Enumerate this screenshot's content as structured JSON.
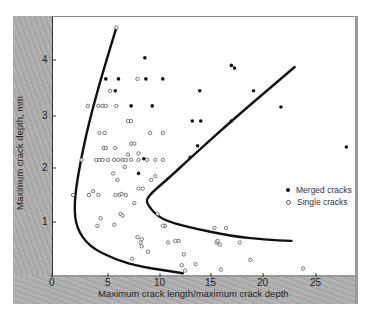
{
  "chart_data": {
    "type": "scatter",
    "title": "",
    "xlabel": "Maximum crack length/maximum crack depth",
    "ylabel": "Maximum crack depth, mm",
    "xlim": [
      0,
      28.7
    ],
    "ylim": [
      0,
      4.8
    ],
    "x_ticks": [
      "0",
      "5",
      "10",
      "15",
      "20",
      "25"
    ],
    "y_ticks": [
      "0",
      "1",
      "2",
      "3",
      "4"
    ],
    "grid": false,
    "legend_position": "right-middle",
    "legend": [
      {
        "label": "Merged cracks",
        "marker": "filled-circle"
      },
      {
        "label": "Single cracks",
        "marker": "open-circle"
      }
    ],
    "series": [
      {
        "name": "Merged cracks",
        "marker": "filled-circle",
        "points": [
          [
            8.8,
            4.04
          ],
          [
            5.1,
            3.65
          ],
          [
            6.3,
            3.65
          ],
          [
            8.9,
            3.65
          ],
          [
            10.5,
            3.65
          ],
          [
            6.0,
            3.43
          ],
          [
            7.5,
            3.15
          ],
          [
            9.5,
            3.15
          ],
          [
            17.0,
            3.9
          ],
          [
            17.3,
            3.85
          ],
          [
            14.0,
            3.43
          ],
          [
            19.1,
            3.43
          ],
          [
            13.3,
            2.87
          ],
          [
            14.1,
            2.87
          ],
          [
            17.0,
            2.87
          ],
          [
            13.8,
            2.41
          ],
          [
            13.1,
            2.2
          ],
          [
            27.9,
            2.39
          ],
          [
            8.7,
            2.17
          ],
          [
            8.2,
            1.9
          ],
          [
            21.7,
            3.13
          ]
        ]
      },
      {
        "name": "Single cracks",
        "marker": "open-circle",
        "points": [
          [
            6.1,
            4.6
          ],
          [
            8.1,
            3.65
          ],
          [
            5.5,
            3.43
          ],
          [
            4.4,
            3.15
          ],
          [
            4.8,
            3.15
          ],
          [
            5.1,
            3.15
          ],
          [
            6.1,
            3.15
          ],
          [
            3.4,
            3.15
          ],
          [
            7.2,
            2.87
          ],
          [
            7.5,
            2.87
          ],
          [
            4.5,
            2.65
          ],
          [
            5.0,
            2.65
          ],
          [
            9.3,
            2.65
          ],
          [
            10.5,
            2.65
          ],
          [
            4.9,
            2.37
          ],
          [
            5.1,
            2.37
          ],
          [
            6.0,
            2.37
          ],
          [
            7.5,
            2.45
          ],
          [
            7.8,
            2.45
          ],
          [
            2.8,
            2.15
          ],
          [
            4.2,
            2.15
          ],
          [
            4.5,
            2.15
          ],
          [
            4.8,
            2.15
          ],
          [
            5.3,
            2.15
          ],
          [
            5.9,
            2.15
          ],
          [
            6.3,
            2.15
          ],
          [
            6.7,
            2.15
          ],
          [
            7.0,
            2.15
          ],
          [
            7.5,
            2.15
          ],
          [
            8.2,
            2.15
          ],
          [
            9.0,
            2.15
          ],
          [
            9.8,
            2.15
          ],
          [
            10.5,
            2.15
          ],
          [
            7.2,
            2.25
          ],
          [
            8.2,
            2.27
          ],
          [
            6.9,
            2.02
          ],
          [
            5.8,
            1.9
          ],
          [
            6.2,
            1.78
          ],
          [
            9.4,
            1.78
          ],
          [
            9.8,
            1.85
          ],
          [
            2.0,
            1.5
          ],
          [
            3.5,
            1.5
          ],
          [
            3.9,
            1.57
          ],
          [
            4.4,
            1.5
          ],
          [
            6.0,
            1.5
          ],
          [
            6.4,
            1.5
          ],
          [
            6.6,
            1.52
          ],
          [
            7.0,
            1.5
          ],
          [
            8.2,
            1.62
          ],
          [
            8.6,
            1.62
          ],
          [
            7.8,
            1.35
          ],
          [
            4.6,
            1.07
          ],
          [
            6.5,
            1.15
          ],
          [
            6.7,
            1.12
          ],
          [
            4.3,
            0.93
          ],
          [
            5.9,
            0.95
          ],
          [
            10.0,
            1.15
          ],
          [
            8.1,
            0.72
          ],
          [
            8.4,
            0.62
          ],
          [
            8.5,
            0.68
          ],
          [
            8.5,
            0.55
          ],
          [
            9.1,
            0.45
          ],
          [
            10.7,
            0.93
          ],
          [
            11.0,
            0.62
          ],
          [
            12.0,
            0.65
          ],
          [
            12.5,
            0.4
          ],
          [
            12.3,
            0.2
          ],
          [
            13.6,
            0.22
          ],
          [
            15.4,
            0.89
          ],
          [
            16.5,
            0.89
          ],
          [
            15.6,
            0.62
          ],
          [
            15.7,
            0.65
          ],
          [
            15.9,
            0.58
          ],
          [
            17.8,
            0.62
          ],
          [
            11.7,
            0.65
          ],
          [
            10.5,
            0.93
          ],
          [
            16.0,
            0.12
          ],
          [
            18.8,
            0.3
          ],
          [
            23.8,
            0.14
          ],
          [
            12.6,
            0.1
          ],
          [
            7.6,
            0.32
          ]
        ]
      }
    ],
    "boundary_curves": [
      {
        "name": "left boundary (single cracks)",
        "points": [
          [
            6.1,
            4.6
          ],
          [
            4.4,
            3.5
          ],
          [
            3.2,
            2.6
          ],
          [
            2.4,
            1.8
          ],
          [
            2.1,
            1.3
          ],
          [
            2.3,
            0.9
          ],
          [
            3.5,
            0.55
          ],
          [
            6.0,
            0.3
          ],
          [
            8.5,
            0.17
          ],
          [
            12.4,
            0.05
          ]
        ]
      },
      {
        "name": "right boundary (merged/single separation)",
        "points": [
          [
            23.0,
            3.87
          ],
          [
            17.0,
            2.87
          ],
          [
            13.2,
            2.2
          ],
          [
            11.0,
            1.8
          ],
          [
            8.9,
            1.45
          ],
          [
            9.1,
            1.3
          ],
          [
            10.3,
            1.05
          ],
          [
            13.0,
            0.9
          ],
          [
            17.0,
            0.74
          ],
          [
            20.2,
            0.67
          ],
          [
            22.7,
            0.65
          ]
        ]
      }
    ]
  },
  "figure": {
    "xlabel": "Maximum crack length/maximum crack depth",
    "ylabel": "Maximum crack depth, mm",
    "legend": {
      "merged": "Merged cracks",
      "single": "Single cracks"
    },
    "x_ticks": [
      {
        "label": "0",
        "px": 52
      },
      {
        "label": "5",
        "px": 108
      },
      {
        "label": "10",
        "px": 160
      },
      {
        "label": "15",
        "px": 211
      },
      {
        "label": "20",
        "px": 263
      },
      {
        "label": "25",
        "px": 316
      }
    ],
    "y_ticks": [
      {
        "label": "4",
        "px": 60
      },
      {
        "label": "3",
        "px": 116
      },
      {
        "label": "2",
        "px": 168
      },
      {
        "label": "1",
        "px": 222
      }
    ]
  }
}
